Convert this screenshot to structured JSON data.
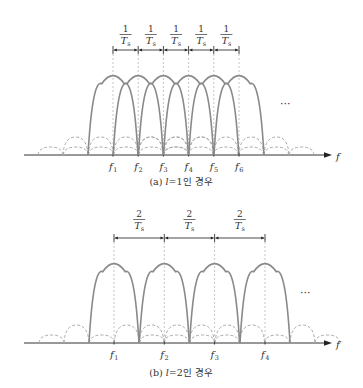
{
  "figure": {
    "panel_a": {
      "caption": "(a) l=1인 경우",
      "caption_prefix": "(a) ",
      "caption_var": "l",
      "caption_suffix": "=1인 경우",
      "spacing_label": {
        "numerator": "1",
        "denominator": "T",
        "subscript": "s"
      },
      "axis_label": "f",
      "carriers": [
        "f1",
        "f2",
        "f3",
        "f4",
        "f5",
        "f6"
      ],
      "carrier_subscripts": [
        "1",
        "2",
        "3",
        "4",
        "5",
        "6"
      ],
      "ellipsis": "···"
    },
    "panel_b": {
      "caption": "(b) l=2인 경우",
      "caption_prefix": "(b) ",
      "caption_var": "l",
      "caption_suffix": "=2인 경우",
      "spacing_label": {
        "numerator": "2",
        "denominator": "T",
        "subscript": "s"
      },
      "axis_label": "f",
      "carriers": [
        "f1",
        "f2",
        "f3",
        "f4"
      ],
      "carrier_subscripts": [
        "1",
        "2",
        "3",
        "4"
      ],
      "ellipsis": "···"
    }
  },
  "colors": {
    "main_lobe": "#8a8a8a",
    "side_lobe": "#a8a8a8",
    "axis": "#333333"
  }
}
